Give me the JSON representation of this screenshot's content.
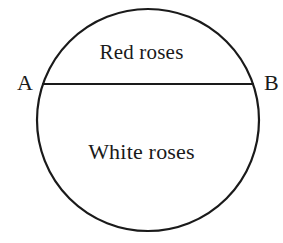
{
  "figure": {
    "type": "circle-diagram",
    "stroke_color": "#1a1a1a",
    "fill_color": "#ffffff",
    "background_color": "#ffffff",
    "circle": {
      "center_x": 148,
      "center_y": 120,
      "radius": 111,
      "stroke_width": 2.2
    },
    "chord": {
      "name": "AB",
      "y": 84,
      "x_start": 43,
      "x_end": 253,
      "stroke_width": 2.2
    },
    "points": [
      {
        "id": "A",
        "label": "A",
        "x": 43,
        "y": 84,
        "label_side": "left"
      },
      {
        "id": "B",
        "label": "B",
        "x": 253,
        "y": 84,
        "label_side": "right"
      }
    ],
    "regions": [
      {
        "id": "upper-segment",
        "label": "Red roses",
        "position": "above-chord"
      },
      {
        "id": "lower-segment",
        "label": "White roses",
        "position": "below-chord"
      }
    ]
  }
}
